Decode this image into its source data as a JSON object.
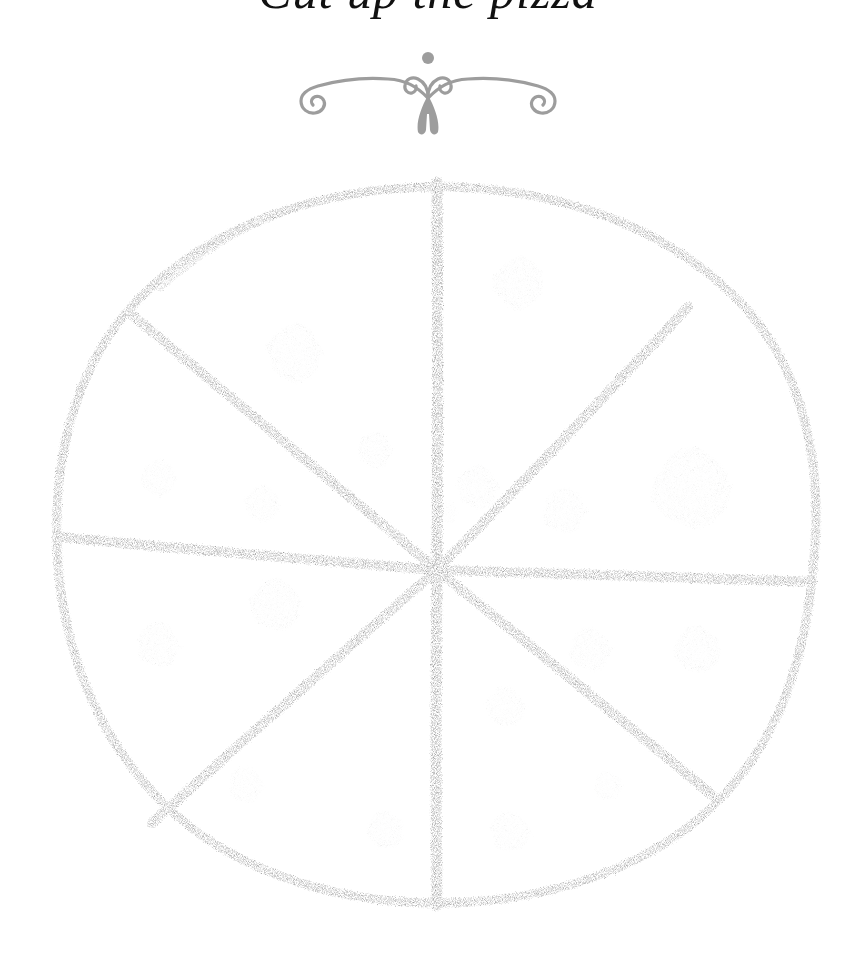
{
  "page": {
    "background_color": "#ffffff",
    "width": 856,
    "height": 958,
    "medium": "pencil-sketch"
  },
  "header": {
    "title_partial": "Cut up the pizza",
    "title_note": "cropped at top edge of image, only bottoms of letters visible",
    "title_color": "#111111"
  },
  "ornament": {
    "name": "decorative-flourish",
    "description": "symmetric scroll flourish with spiral ends, centered dot above and leaf finial below",
    "color": "#9d9d9d",
    "width": 280,
    "height": 95
  },
  "drawing": {
    "name": "pizza-diagram",
    "stroke_color": "#6f6f6f",
    "stroke_color_dark": "#4a4a4a",
    "topping_color": "#9a9a98",
    "circle": {
      "center_x": 437,
      "center_y": 570,
      "radius_x": 382,
      "radius_y": 363,
      "stroke_width": 9
    },
    "slice_count": 8,
    "divider_label": "8 equal sectors",
    "dividers": [
      {
        "name": "vertical-divider",
        "x1": 437,
        "y1": 182,
        "x2": 437,
        "y2": 905,
        "width": 11
      },
      {
        "name": "horizontal-divider",
        "x1": 58,
        "y1": 537,
        "x2": 812,
        "y2": 582,
        "width": 10
      },
      {
        "name": "diagonal-nw-se",
        "x1": 130,
        "y1": 313,
        "x2": 712,
        "y2": 795,
        "width": 10
      },
      {
        "name": "diagonal-ne-sw",
        "x1": 688,
        "y1": 307,
        "x2": 152,
        "y2": 823,
        "width": 10
      }
    ],
    "toppings": [
      {
        "name": "pepperoni-1",
        "cx": 518,
        "cy": 283,
        "r": 22,
        "tone": 0.62
      },
      {
        "name": "pepperoni-2",
        "cx": 294,
        "cy": 353,
        "r": 24,
        "tone": 0.58
      },
      {
        "name": "pepperoni-3",
        "cx": 375,
        "cy": 450,
        "r": 15,
        "tone": 0.55
      },
      {
        "name": "pepperoni-4",
        "cx": 158,
        "cy": 478,
        "r": 15,
        "tone": 0.5
      },
      {
        "name": "pepperoni-5",
        "cx": 262,
        "cy": 504,
        "r": 15,
        "tone": 0.5
      },
      {
        "name": "pepperoni-6",
        "cx": 477,
        "cy": 487,
        "r": 18,
        "tone": 0.56
      },
      {
        "name": "pepperoni-7",
        "cx": 564,
        "cy": 511,
        "r": 19,
        "tone": 0.55
      },
      {
        "name": "pepperoni-8",
        "cx": 691,
        "cy": 489,
        "r": 34,
        "tone": 0.6
      },
      {
        "name": "pepperoni-9",
        "cx": 275,
        "cy": 605,
        "r": 22,
        "tone": 0.58
      },
      {
        "name": "pepperoni-10",
        "cx": 158,
        "cy": 645,
        "r": 19,
        "tone": 0.56
      },
      {
        "name": "pepperoni-11",
        "cx": 590,
        "cy": 650,
        "r": 18,
        "tone": 0.55
      },
      {
        "name": "pepperoni-12",
        "cx": 697,
        "cy": 650,
        "r": 20,
        "tone": 0.56
      },
      {
        "name": "pepperoni-13",
        "cx": 505,
        "cy": 707,
        "r": 17,
        "tone": 0.45
      },
      {
        "name": "pepperoni-14",
        "cx": 246,
        "cy": 785,
        "r": 15,
        "tone": 0.42
      },
      {
        "name": "pepperoni-15",
        "cx": 608,
        "cy": 786,
        "r": 12,
        "tone": 0.32
      },
      {
        "name": "pepperoni-16",
        "cx": 385,
        "cy": 830,
        "r": 16,
        "tone": 0.48
      },
      {
        "name": "pepperoni-17",
        "cx": 510,
        "cy": 832,
        "r": 17,
        "tone": 0.5
      },
      {
        "name": "pepperoni-18",
        "cx": 446,
        "cy": 512,
        "r": 10,
        "tone": 0.3
      }
    ]
  }
}
